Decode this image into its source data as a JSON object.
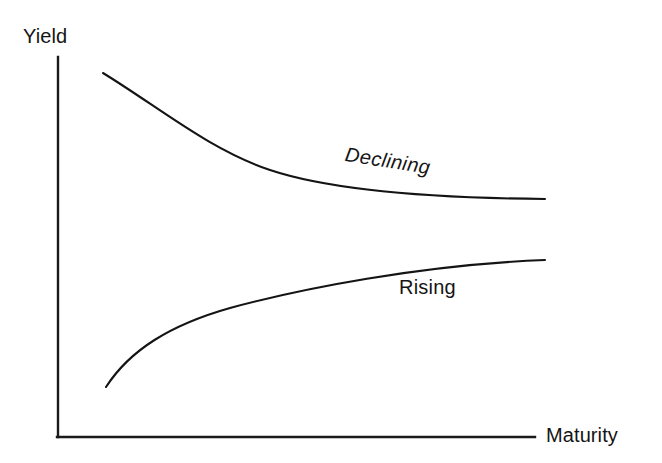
{
  "figure": {
    "background_color": "#ffffff",
    "line_color": "#141414",
    "axis_color": "#1a1a1a",
    "width": 662,
    "height": 463
  },
  "axes": {
    "y_axis_label": "Yield",
    "x_axis_label": "Maturity",
    "origin": {
      "x": 58,
      "y": 437
    },
    "y_axis_top": {
      "x": 58,
      "y": 57
    },
    "x_axis_end": {
      "x": 535,
      "y": 437
    }
  },
  "curves": {
    "declining": {
      "label": "Declining",
      "style": "italic",
      "path": "M 103 73 C 160 108, 210 150, 270 170 C 330 190, 430 198, 545 199"
    },
    "rising": {
      "label": "Rising",
      "style": "normal",
      "path": "M 106 387 C 130 350, 170 325, 230 308 C 300 289, 420 265, 545 260"
    }
  },
  "chart_data": {
    "type": "line",
    "title": "",
    "xlabel": "Maturity",
    "ylabel": "Yield",
    "grid": false,
    "legend": "inline-annotations",
    "axis_ticks": {
      "x": [],
      "y": []
    },
    "xlim": [
      0,
      1
    ],
    "ylim": [
      0,
      1
    ],
    "annotations": [
      {
        "text": "Declining",
        "x": 0.62,
        "y": 0.62,
        "style": "italic"
      },
      {
        "text": "Rising",
        "x": 0.72,
        "y": 0.38,
        "style": "normal"
      }
    ],
    "series": [
      {
        "name": "Declining",
        "description": "Downward sloping yield curve: high short-term yield decaying asymptotically to a low long-term level",
        "x": [
          0.09,
          0.15,
          0.25,
          0.35,
          0.45,
          0.55,
          0.65,
          0.75,
          0.85,
          0.95,
          1.0
        ],
        "y": [
          0.96,
          0.89,
          0.77,
          0.68,
          0.62,
          0.58,
          0.55,
          0.53,
          0.52,
          0.515,
          0.51
        ]
      },
      {
        "name": "Rising",
        "description": "Upward sloping yield curve: low short-term yield rising asymptotically to a higher long-term level",
        "x": [
          0.1,
          0.15,
          0.25,
          0.35,
          0.45,
          0.55,
          0.65,
          0.75,
          0.85,
          0.95,
          1.0
        ],
        "y": [
          0.13,
          0.21,
          0.29,
          0.34,
          0.37,
          0.39,
          0.405,
          0.415,
          0.42,
          0.425,
          0.43
        ]
      }
    ]
  }
}
